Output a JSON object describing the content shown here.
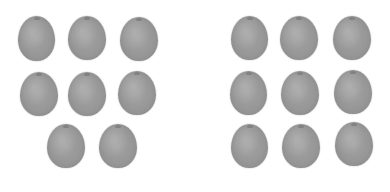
{
  "scene": {
    "description": "Two groups of gray round fruits (kiwis) on white background",
    "background_color": "#ffffff",
    "fruit_color": "#999999"
  },
  "groups": [
    {
      "name": "left-group",
      "count": 8,
      "fruits": [
        {
          "x": 18,
          "y": 16,
          "w": 37,
          "h": 45
        },
        {
          "x": 68,
          "y": 16,
          "w": 38,
          "h": 44
        },
        {
          "x": 120,
          "y": 17,
          "w": 38,
          "h": 44
        },
        {
          "x": 20,
          "y": 72,
          "w": 38,
          "h": 44
        },
        {
          "x": 68,
          "y": 72,
          "w": 38,
          "h": 44
        },
        {
          "x": 118,
          "y": 71,
          "w": 38,
          "h": 44
        },
        {
          "x": 47,
          "y": 124,
          "w": 38,
          "h": 44
        },
        {
          "x": 99,
          "y": 124,
          "w": 38,
          "h": 44
        }
      ]
    },
    {
      "name": "right-group",
      "count": 9,
      "fruits": [
        {
          "x": 231,
          "y": 16,
          "w": 37,
          "h": 44
        },
        {
          "x": 280,
          "y": 16,
          "w": 38,
          "h": 44
        },
        {
          "x": 333,
          "y": 16,
          "w": 38,
          "h": 44
        },
        {
          "x": 230,
          "y": 71,
          "w": 37,
          "h": 44
        },
        {
          "x": 281,
          "y": 71,
          "w": 38,
          "h": 44
        },
        {
          "x": 334,
          "y": 70,
          "w": 38,
          "h": 44
        },
        {
          "x": 231,
          "y": 124,
          "w": 37,
          "h": 44
        },
        {
          "x": 282,
          "y": 124,
          "w": 38,
          "h": 44
        },
        {
          "x": 335,
          "y": 122,
          "w": 38,
          "h": 44
        }
      ]
    }
  ]
}
